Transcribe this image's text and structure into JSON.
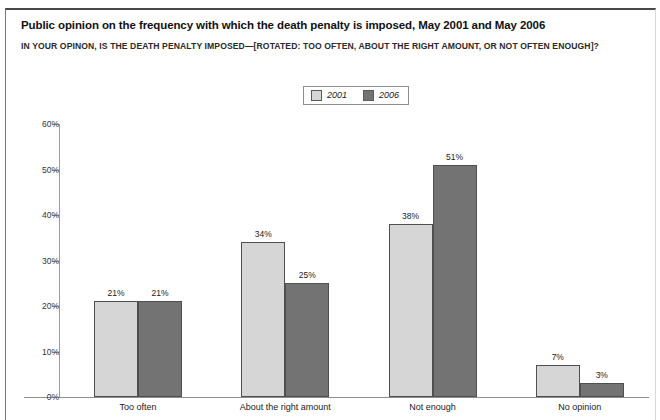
{
  "figure": {
    "title": "Public opinion on the frequency with which the death penalty is imposed, May 2001 and May 2006",
    "subtitle": "IN YOUR OPINON, IS THE DEATH PENALTY IMPOSED—[ROTATED: TOO OFTEN, ABOUT THE RIGHT AMOUNT, OR NOT OFTEN ENOUGH]?"
  },
  "colors": {
    "series_2001": "#d6d6d6",
    "series_2006": "#737373",
    "bar_outline": "#4f4f4f",
    "axis": "#9a9a9a",
    "text": "#222222"
  },
  "legend": {
    "position": "top-center",
    "entries": [
      {
        "label": "2001",
        "swatch": "light-gray-swatch"
      },
      {
        "label": "2006",
        "swatch": "dark-gray-swatch"
      }
    ]
  },
  "chart_data": {
    "type": "bar",
    "title": "Public opinion on the frequency with which the death penalty is imposed, May 2001 and May 2006",
    "subtitle": "IN YOUR OPINON, IS THE DEATH PENALTY IMPOSED—[ROTATED: TOO OFTEN, ABOUT THE RIGHT AMOUNT, OR NOT OFTEN ENOUGH]?",
    "xlabel": "",
    "ylabel": "",
    "ylim": [
      0,
      60
    ],
    "ytick_labels": [
      "0%",
      "10%",
      "20%",
      "30%",
      "40%",
      "50%",
      "60%"
    ],
    "ytick_values": [
      0,
      10,
      20,
      30,
      40,
      50,
      60
    ],
    "grid": false,
    "legend_position": "top-center",
    "categories": [
      "Too often",
      "About the right amount",
      "Not enough",
      "No opinion"
    ],
    "series": [
      {
        "name": "2001",
        "color": "#d6d6d6",
        "values": [
          21,
          34,
          38,
          7
        ],
        "labels": [
          "21%",
          "34%",
          "38%",
          "7%"
        ]
      },
      {
        "name": "2006",
        "color": "#737373",
        "values": [
          21,
          25,
          51,
          3
        ],
        "labels": [
          "21%",
          "25%",
          "51%",
          "3%"
        ]
      }
    ]
  }
}
